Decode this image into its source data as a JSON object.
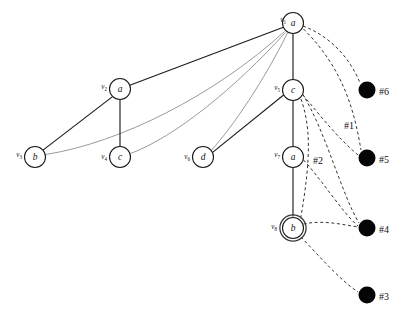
{
  "figure": {
    "width": 411,
    "height": 320,
    "background": "#ffffff"
  },
  "palette": {
    "node_fill": "#ffffff",
    "node_stroke": "#1a1a1a",
    "edge_dark": "#1c1c1c",
    "edge_gray": "#9a9a9a",
    "edge_dashed": "#2a2a2a",
    "terminal_dot": "#050505",
    "text": "#111111"
  },
  "nodes": [
    {
      "id": "v1",
      "id_text": "v",
      "id_sub": "1",
      "label": "a",
      "x": 293,
      "y": 23,
      "r": 10.5,
      "double_ring": false,
      "id_x": 286,
      "id_y": 20
    },
    {
      "id": "v2",
      "id_text": "v",
      "id_sub": "2",
      "label": "a",
      "x": 120,
      "y": 89,
      "r": 10.5,
      "double_ring": false,
      "id_x": 107,
      "id_y": 87
    },
    {
      "id": "v3",
      "id_text": "v",
      "id_sub": "3",
      "label": "b",
      "x": 35,
      "y": 157,
      "r": 10.5,
      "double_ring": false,
      "id_x": 22,
      "id_y": 155
    },
    {
      "id": "v4",
      "id_text": "v",
      "id_sub": "4",
      "label": "c",
      "x": 120,
      "y": 157,
      "r": 10.5,
      "double_ring": false,
      "id_x": 107,
      "id_y": 157
    },
    {
      "id": "v5",
      "id_text": "v",
      "id_sub": "5",
      "label": "c",
      "x": 293,
      "y": 90,
      "r": 10.5,
      "double_ring": false,
      "id_x": 280,
      "id_y": 88
    },
    {
      "id": "v6",
      "id_text": "v",
      "id_sub": "6",
      "label": "d",
      "x": 203,
      "y": 157,
      "r": 10.5,
      "double_ring": false,
      "id_x": 190,
      "id_y": 157
    },
    {
      "id": "v7",
      "id_text": "v",
      "id_sub": "7",
      "label": "a",
      "x": 293,
      "y": 157,
      "r": 10.5,
      "double_ring": false,
      "id_x": 280,
      "id_y": 155
    },
    {
      "id": "v8",
      "id_text": "v",
      "id_sub": "8",
      "label": "b",
      "x": 293,
      "y": 228,
      "r": 10.5,
      "double_ring": true,
      "id_x": 277,
      "id_y": 227
    }
  ],
  "terminals": [
    {
      "id": "t6",
      "label": "#6",
      "x": 367,
      "y": 90,
      "r": 8.5,
      "label_x": 379,
      "label_y": 91
    },
    {
      "id": "t5",
      "label": "#5",
      "x": 367,
      "y": 158,
      "r": 8.5,
      "label_x": 379,
      "label_y": 159
    },
    {
      "id": "t4",
      "label": "#4",
      "x": 367,
      "y": 228,
      "r": 8.5,
      "label_x": 379,
      "label_y": 229
    },
    {
      "id": "t3",
      "label": "#3",
      "x": 367,
      "y": 295,
      "r": 8.5,
      "label_x": 379,
      "label_y": 296
    }
  ],
  "edge_tags": [
    {
      "id": "tag1",
      "label": "#1",
      "x": 344,
      "y": 125
    },
    {
      "id": "tag2",
      "label": "#2",
      "x": 313,
      "y": 160
    }
  ],
  "edges_solid_dark": [
    {
      "id": "e-v1-v2",
      "from": "v1",
      "to": "v2",
      "d": "M 283.4 27.3 L 129.8 85.3"
    },
    {
      "id": "e-v2-v3",
      "from": "v2",
      "to": "v3",
      "d": "M 112.2 96.9 L 43.0 150.1"
    },
    {
      "id": "e-v2-v4",
      "from": "v2",
      "to": "v4",
      "d": "M 120 99.5 L 120 146.5"
    },
    {
      "id": "e-v1-v5",
      "from": "v1",
      "to": "v5",
      "d": "M 293 33.5 L 293 79.5"
    },
    {
      "id": "e-v5-v6",
      "from": "v5",
      "to": "v6",
      "d": "M 283.6 95.0 L 212.6 152.4"
    },
    {
      "id": "e-v5-v7",
      "from": "v5",
      "to": "v7",
      "d": "M 293 100.5 L 293 146.5"
    },
    {
      "id": "e-v7-v8",
      "from": "v7",
      "to": "v8",
      "d": "M 293 167.5 L 293 216.5"
    }
  ],
  "edges_solid_gray": [
    {
      "id": "e-v1-v3",
      "from": "v1",
      "to": "v3",
      "d": "M 284.5 31.5 C 215 95, 120 143, 45.5 154.5"
    },
    {
      "id": "e-v1-v4",
      "from": "v1",
      "to": "v4",
      "d": "M 285.5 32.5 C 235 88, 175 137, 130.5 153.5"
    },
    {
      "id": "e-v1-v6",
      "from": "v1",
      "to": "v6",
      "d": "M 287.5 33.0 C 265 79, 232 128, 211.5 150.0"
    }
  ],
  "edges_dashed": [
    {
      "id": "d-v1-t6",
      "from": "v1",
      "to": "t6",
      "d": "M 303 26 C 330 36, 350 58, 360 83"
    },
    {
      "id": "d-v1-t5",
      "from": "v1",
      "to": "t5",
      "d": "M 303.5 29 C 345 70, 355 115, 361 150"
    },
    {
      "id": "d-v5-t4",
      "from": "v5",
      "to": "t4",
      "d": "M 302.5 94 C 325 130, 342 195, 359 223"
    },
    {
      "id": "d-v5-v8mid",
      "from": "v5",
      "to": "t5",
      "d": "M 303 95 C 322 118, 340 140, 358 155"
    },
    {
      "id": "d-v5-cross",
      "from": "v5",
      "to": "cross",
      "d": "M 301 99 C 310 125, 312 155, 300 222"
    },
    {
      "id": "d-v7-t4",
      "from": "v7",
      "to": "t4",
      "d": "M 303.5 160 C 322 180, 342 212, 358 226"
    },
    {
      "id": "d-v8-t4",
      "from": "v8",
      "to": "t4",
      "d": "M 303.5 224 C 322 220, 340 224, 358 227"
    },
    {
      "id": "d-v8-t3",
      "from": "v8",
      "to": "t3",
      "d": "M 301 237 C 320 257, 340 280, 358 292"
    }
  ]
}
